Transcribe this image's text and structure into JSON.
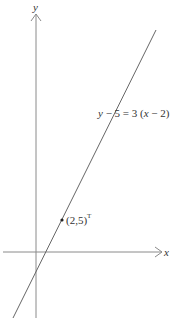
{
  "diagram": {
    "axes": {
      "x_label": "x",
      "y_label": "y",
      "color": "#888888"
    },
    "line": {
      "equation": "y − 5 = 3 (x − 2)",
      "color": "#555555"
    },
    "point": {
      "label": "(2,5)",
      "superscript": "T",
      "color": "#222222"
    }
  }
}
